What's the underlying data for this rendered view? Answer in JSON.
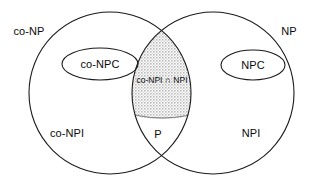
{
  "diagram": {
    "type": "venn",
    "background_color": "#ffffff",
    "stroke_color": "#1a1a1a",
    "shade_color": "#c9c9c9",
    "sets": [
      {
        "key": "co_np",
        "label": "co-NP",
        "shape": "circle",
        "cx": 110,
        "cy": 93,
        "r": 81
      },
      {
        "key": "np",
        "label": "NP",
        "shape": "circle",
        "cx": 213,
        "cy": 93,
        "r": 81
      },
      {
        "key": "co_npc",
        "label": "co-NPC",
        "shape": "ellipse",
        "cx": 100,
        "cy": 64,
        "rx": 38,
        "ry": 16
      },
      {
        "key": "npc",
        "label": "NPC",
        "shape": "ellipse",
        "cx": 253,
        "cy": 65,
        "rx": 32,
        "ry": 15
      }
    ],
    "regions": [
      {
        "key": "co_npi",
        "label": "co-NPI"
      },
      {
        "key": "npi",
        "label": "NPI"
      },
      {
        "key": "p",
        "label": "P"
      },
      {
        "key": "co_npi_cap_npi",
        "label": "co-NPI ∩ NPI",
        "shaded": true
      }
    ],
    "labels": {
      "co_np": "co-NP",
      "np": "NP",
      "co_npc": "co-NPC",
      "npc": "NPC",
      "co_npi": "co-NPI",
      "npi": "NPI",
      "p": "P",
      "intersection": "co-NPI ∩ NPI"
    }
  }
}
